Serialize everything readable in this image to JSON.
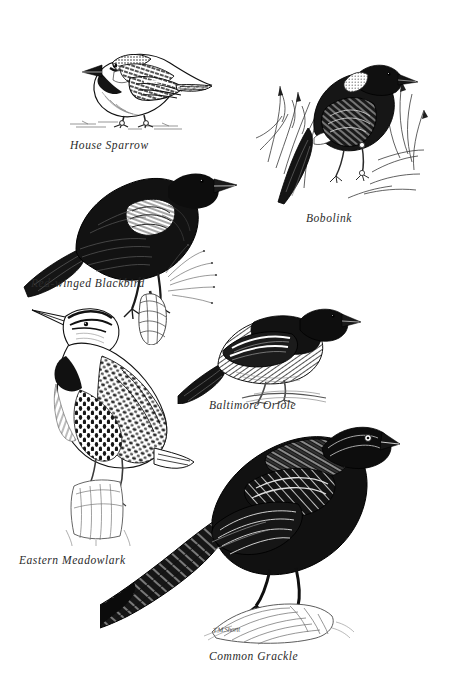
{
  "plate": {
    "background_color": "#ffffff",
    "ink_color": "#111111",
    "width": 451,
    "height": 700
  },
  "signature": {
    "text": "T.M.Shortt"
  },
  "birds": [
    {
      "id": "house-sparrow",
      "caption": "House Sparrow",
      "facing": "left",
      "perch": "ground",
      "plumage": "gray crown, black bib, streaked brown wings, pale belly"
    },
    {
      "id": "bobolink",
      "caption": "Bobolink",
      "facing": "right",
      "perch": "grass stems",
      "plumage": "black body with pale buff nape patch, white rump and scapulars"
    },
    {
      "id": "red-winged-blackbird",
      "caption": "Red-winged Blackbird",
      "facing": "right",
      "perch": "cattail stalk",
      "plumage": "all black with pale shoulder epaulet"
    },
    {
      "id": "baltimore-oriole",
      "caption": "Baltimore Oriole",
      "facing": "right",
      "perch": "branch",
      "plumage": "black hood and back, white wing bars, pale underparts"
    },
    {
      "id": "eastern-meadowlark",
      "caption": "Eastern Meadowlark",
      "facing": "left",
      "perch": "fence post",
      "plumage": "striped head, black breast V, heavily spotted flanks"
    },
    {
      "id": "common-grackle",
      "caption": "Common Grackle",
      "facing": "right",
      "perch": "rock",
      "plumage": "glossy black, pale eye, long keeled tail"
    }
  ]
}
